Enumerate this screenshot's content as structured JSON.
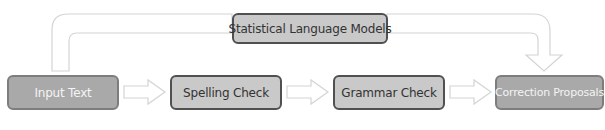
{
  "diagram": {
    "nodes": [
      {
        "id": "input",
        "label": "Input Text"
      },
      {
        "id": "spelling",
        "label": "Spelling Check"
      },
      {
        "id": "grammar",
        "label": "Grammar Check"
      },
      {
        "id": "correction",
        "label": "Correction Proposals"
      },
      {
        "id": "slm",
        "label": "Statistical Language Models"
      }
    ],
    "edges": [
      {
        "from": "input",
        "to": "spelling"
      },
      {
        "from": "spelling",
        "to": "grammar"
      },
      {
        "from": "grammar",
        "to": "correction"
      },
      {
        "from": "input",
        "to": "slm"
      },
      {
        "from": "slm",
        "to": "correction"
      }
    ],
    "colors": {
      "endpoint_fill": "#a9a9a9",
      "process_fill": "#c9c9c9",
      "arrow_stroke": "#d0d0d0"
    }
  }
}
